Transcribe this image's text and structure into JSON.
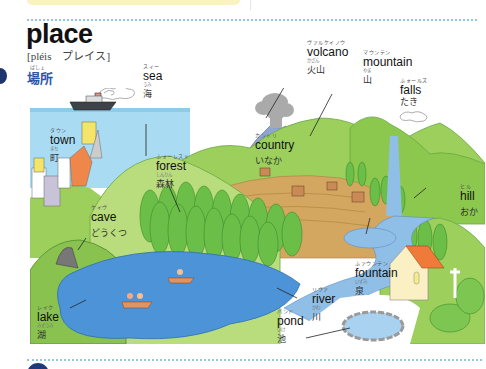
{
  "page": {
    "word": "place",
    "pronunciation": "[pléis　プレイス]",
    "japanese_ruby": "ばしょ",
    "japanese": "場所"
  },
  "labels": [
    {
      "id": "sea",
      "ruby": "スィー",
      "en": "sea",
      "jp_ruby": "うみ",
      "jp": "海"
    },
    {
      "id": "volcano",
      "ruby": "ヴァルケイノウ",
      "en": "volcano",
      "jp_ruby": "かざん",
      "jp": "火山"
    },
    {
      "id": "mountain",
      "ruby": "マウンテン",
      "en": "mountain",
      "jp_ruby": "やま",
      "jp": "山"
    },
    {
      "id": "falls",
      "ruby": "ふォールズ",
      "en": "falls",
      "jp_ruby": "",
      "jp": "たき"
    },
    {
      "id": "town",
      "ruby": "タウン",
      "en": "town",
      "jp_ruby": "まち",
      "jp": "町"
    },
    {
      "id": "country",
      "ruby": "カントリ",
      "en": "country",
      "jp_ruby": "",
      "jp": "いなか"
    },
    {
      "id": "forest",
      "ruby": "ふォーレスト",
      "en": "forest",
      "jp_ruby": "しんりん",
      "jp": "森林"
    },
    {
      "id": "hill",
      "ruby": "ヒル",
      "en": "hill",
      "jp_ruby": "",
      "jp": "おか"
    },
    {
      "id": "cave",
      "ruby": "ケイヴ",
      "en": "cave",
      "jp_ruby": "",
      "jp": "どうくつ"
    },
    {
      "id": "fountain",
      "ruby": "ふァウンテン",
      "en": "fountain",
      "jp_ruby": "いずみ",
      "jp": "泉"
    },
    {
      "id": "river",
      "ruby": "リヴァ",
      "en": "river",
      "jp_ruby": "かわ",
      "jp": "川"
    },
    {
      "id": "pond",
      "ruby": "パンド",
      "en": "pond",
      "jp_ruby": "いけ",
      "jp": "池"
    },
    {
      "id": "lake",
      "ruby": "レイク",
      "en": "lake",
      "jp_ruby": "みずうみ",
      "jp": "湖"
    }
  ],
  "colors": {
    "title_jp": "#2d56a6",
    "dotted_rule": "#8ec9e4",
    "sea": "#a9dcf3",
    "lake": "#4d93d8",
    "grass": "#9ccf5c",
    "grass_dark": "#74b446",
    "volcano": "#8ea5d4",
    "field": "#d3a760"
  }
}
